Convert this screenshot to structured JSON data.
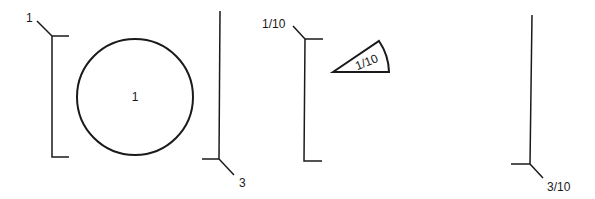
{
  "diagram": {
    "groups": [
      {
        "id": "whole-circle",
        "bracket_label": "1",
        "shape": "circle",
        "shape_label": "1",
        "multiplier_label": "3"
      },
      {
        "id": "tenth-wedge",
        "bracket_label": "1/10",
        "shape": "wedge",
        "shape_label": "1/10",
        "multiplier_label": "3/10"
      }
    ]
  }
}
